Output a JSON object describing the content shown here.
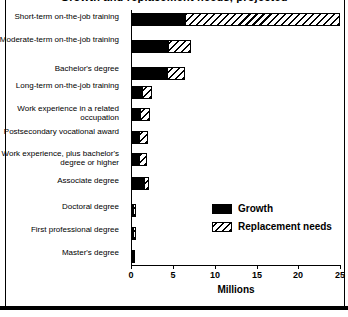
{
  "chart_data": {
    "type": "bar",
    "orientation": "horizontal",
    "stacked": true,
    "title": "Growth and replacement needs, projected",
    "xlabel": "Millions",
    "ylabel": "",
    "xlim": [
      0,
      25
    ],
    "xticks": [
      0,
      5,
      10,
      15,
      20,
      25
    ],
    "xtick_labels": [
      "0",
      "5",
      "10",
      "15",
      "20",
      "25"
    ],
    "grid": false,
    "legend_position": "center-right",
    "categories": [
      "Short-term on-the-job training",
      "Moderate-term on-the-job training",
      "Bachelor's degree",
      "Long-term on-the-job training",
      "Work experience in a related occupation",
      "Postsecondary vocational award",
      "Work experience, plus bachelor's degree or higher",
      "Associate degree",
      "Doctoral degree",
      "First professional degree",
      "Master's degree"
    ],
    "series": [
      {
        "name": "Growth",
        "color": "#000000",
        "pattern": "solid",
        "values": [
          6.5,
          4.4,
          4.3,
          1.3,
          1.1,
          1.0,
          1.0,
          1.6,
          0.2,
          0.2,
          0.2
        ]
      },
      {
        "name": "Replacement needs",
        "color": "#000000",
        "pattern": "diagonal-hatch",
        "values": [
          18.5,
          2.8,
          2.2,
          1.2,
          1.2,
          1.0,
          0.9,
          0.5,
          0.3,
          0.3,
          0.2
        ]
      }
    ],
    "totals": [
      25.0,
      7.2,
      6.5,
      2.5,
      2.3,
      2.0,
      1.9,
      2.1,
      0.5,
      0.5,
      0.4
    ]
  },
  "legend": {
    "items": [
      {
        "label": "Growth",
        "swatch": "solid-black"
      },
      {
        "label": "Replacement needs",
        "swatch": "diagonal-hatch"
      }
    ]
  },
  "axis": {
    "x_title": "Millions",
    "tick_0": "0",
    "tick_5": "5",
    "tick_10": "10",
    "tick_15": "15",
    "tick_20": "20",
    "tick_25": "25"
  },
  "labels": {
    "cat_0": "Short-term on-the-job training",
    "cat_1": "Moderate-term on-the-job training",
    "cat_2": "Bachelor's degree",
    "cat_3": "Long-term on-the-job training",
    "cat_4": "Work experience in a related occupation",
    "cat_5": "Postsecondary vocational award",
    "cat_6": "Work experience, plus bachelor's degree or higher",
    "cat_7": "Associate degree",
    "cat_8": "Doctoral degree",
    "cat_9": "First professional degree",
    "cat_10": "Master's degree"
  }
}
